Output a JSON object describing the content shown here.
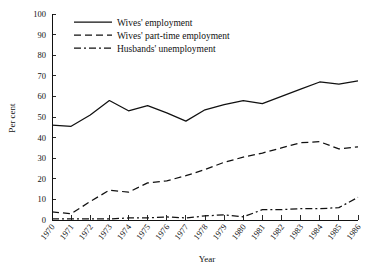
{
  "chart_data": {
    "type": "line",
    "title": "",
    "xlabel": "Year",
    "ylabel": "Per cent",
    "ylim": [
      0,
      100
    ],
    "ytick_step": 10,
    "grid": false,
    "legend_position": "top-left-inside",
    "categories": [
      "1970",
      "1971",
      "1972",
      "1973",
      "1974",
      "1975",
      "1976",
      "1977",
      "1978",
      "1979",
      "1980",
      "1981",
      "1982",
      "1983",
      "1984",
      "1985",
      "1986"
    ],
    "yticks": [
      "0",
      "10",
      "20",
      "30",
      "40",
      "50",
      "60",
      "70",
      "80",
      "90",
      "100"
    ],
    "series": [
      {
        "name": "Wives' employment",
        "style": "solid",
        "values": [
          46,
          45.5,
          51,
          58,
          53,
          55.5,
          52,
          48,
          53.5,
          56,
          58,
          56.5,
          60,
          63.5,
          67,
          66,
          67.5
        ]
      },
      {
        "name": "Wives' part-time employment",
        "style": "dashed",
        "values": [
          4,
          3,
          9,
          14.5,
          13.5,
          18,
          19,
          21.5,
          24.5,
          28,
          30.5,
          32.5,
          35,
          37.5,
          38,
          34.5,
          35.5
        ]
      },
      {
        "name": "Husbands' unemployment",
        "style": "dashdot",
        "values": [
          0.5,
          0.5,
          0.5,
          0.5,
          1,
          1,
          1.5,
          1,
          2,
          2.5,
          1.5,
          5,
          5,
          5.5,
          5.5,
          6,
          11
        ]
      }
    ]
  },
  "legend": {
    "items": [
      {
        "label": "Wives' employment",
        "style": "solid"
      },
      {
        "label": "Wives' part-time employment",
        "style": "dashed"
      },
      {
        "label": "Husbands' unemployment",
        "style": "dashdot"
      }
    ]
  },
  "axes": {
    "y_title": "Per cent",
    "x_title": "Year"
  }
}
